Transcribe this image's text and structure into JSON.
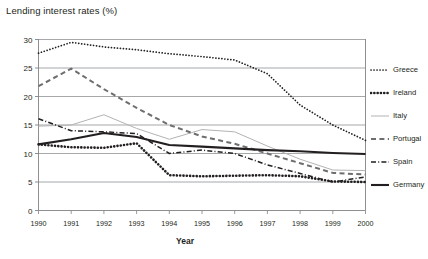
{
  "chart_data": {
    "type": "line",
    "title": "Lending interest rates (%)",
    "xlabel": "Year",
    "ylabel": "",
    "x": [
      1990,
      1991,
      1992,
      1993,
      1994,
      1995,
      1996,
      1997,
      1998,
      1999,
      2000
    ],
    "xtick_labels": [
      "1990",
      "1991",
      "1992",
      "1993",
      "1994",
      "1995",
      "1996",
      "1997",
      "1998",
      "1999",
      "2000"
    ],
    "ytick_labels": [
      "0",
      "5",
      "10",
      "15",
      "20",
      "25",
      "30"
    ],
    "yticks": [
      0,
      5,
      10,
      15,
      20,
      25,
      30
    ],
    "ylim": [
      0,
      30
    ],
    "xlim": [
      1990,
      2000
    ],
    "grid": "horizontal",
    "legend_position": "right",
    "series": [
      {
        "name": "Greece",
        "style": "fine-dotted",
        "color": "#231f20",
        "values": [
          27.6,
          29.5,
          28.7,
          28.2,
          27.5,
          27.0,
          26.4,
          24.0,
          18.5,
          15.0,
          12.3
        ]
      },
      {
        "name": "Ireland",
        "style": "thick-dotted",
        "color": "#231f20",
        "values": [
          11.6,
          11.1,
          11.0,
          11.8,
          6.2,
          6.0,
          6.1,
          6.2,
          6.0,
          5.1,
          5.0
        ]
      },
      {
        "name": "Italy",
        "style": "thin-solid",
        "color": "#b3b3b3",
        "values": [
          14.8,
          15.0,
          16.8,
          14.4,
          12.5,
          14.2,
          13.8,
          11.3,
          9.0,
          7.1,
          7.0
        ]
      },
      {
        "name": "Portugal",
        "style": "dashed",
        "color": "#6d6e71",
        "values": [
          21.8,
          24.9,
          21.3,
          18.0,
          15.0,
          13.0,
          11.7,
          10.0,
          8.3,
          6.6,
          6.3
        ]
      },
      {
        "name": "Spain",
        "style": "dash-dot",
        "color": "#231f20",
        "values": [
          16.1,
          14.0,
          13.8,
          13.5,
          10.0,
          10.6,
          10.0,
          8.0,
          6.5,
          5.0,
          5.9
        ]
      },
      {
        "name": "Germany",
        "style": "thick-solid",
        "color": "#231f20",
        "values": [
          11.6,
          12.5,
          13.6,
          12.9,
          11.5,
          11.2,
          10.9,
          10.6,
          10.4,
          10.1,
          9.9
        ]
      }
    ]
  }
}
